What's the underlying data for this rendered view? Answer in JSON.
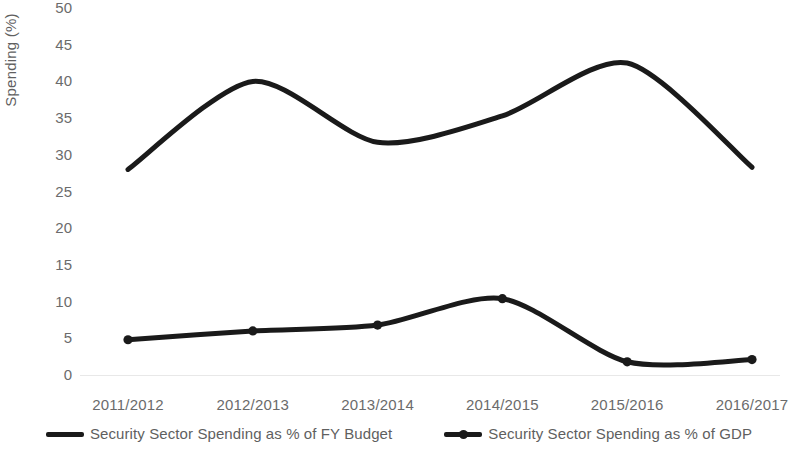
{
  "chart_data": {
    "type": "line",
    "title": "",
    "xlabel": "",
    "ylabel": "Spending (%)",
    "ylim": [
      0,
      50
    ],
    "ytick_step": 5,
    "yticks": [
      50,
      45,
      40,
      35,
      30,
      25,
      20,
      15,
      10,
      5,
      0
    ],
    "grid": false,
    "legend_position": "bottom",
    "categories": [
      "2011/2012",
      "2012/2013",
      "2013/2014",
      "2014/2015",
      "2015/2016",
      "2016/2017"
    ],
    "series": [
      {
        "name": "Security Sector Spending as % of FY Budget",
        "values": [
          28.0,
          40.0,
          31.7,
          35.3,
          42.5,
          28.3
        ],
        "color": "#1a1a1a",
        "marker": "none",
        "smooth": true
      },
      {
        "name": "Security Sector Spending as % of GDP",
        "values": [
          4.8,
          6.0,
          6.8,
          10.4,
          1.8,
          2.1
        ],
        "color": "#1a1a1a",
        "marker": "circle",
        "smooth": true
      }
    ]
  },
  "axes": {
    "y_title": "Spending (%)",
    "y_tick_labels": [
      "50",
      "45",
      "40",
      "35",
      "30",
      "25",
      "20",
      "15",
      "10",
      "5",
      "0"
    ],
    "x_tick_labels": [
      "2011/2012",
      "2012/2013",
      "2013/2014",
      "2014/2015",
      "2015/2016",
      "2016/2017"
    ]
  },
  "legend": {
    "items": [
      {
        "label": "Security Sector Spending as % of FY Budget",
        "marker": "line"
      },
      {
        "label": "Security Sector Spending as % of GDP",
        "marker": "line-circle"
      }
    ]
  },
  "colors": {
    "series_line": "#1a1a1a",
    "tick_text": "#6b6b6b",
    "axis_title": "#5f5f5f",
    "baseline": "#e8e8e8",
    "background": "#ffffff"
  }
}
